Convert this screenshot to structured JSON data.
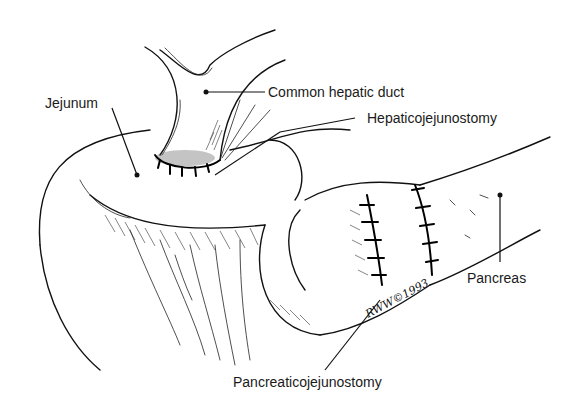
{
  "figure": {
    "labels": {
      "common_hepatic_duct": "Common hepatic duct",
      "jejunum": "Jejunum",
      "hepaticojejunostomy": "Hepaticojejunostomy",
      "pancreas": "Pancreas",
      "pancreaticojejunostomy": "Pancreaticojejunostomy"
    },
    "signature": "RWW©1993",
    "colors": {
      "ink": "#111111",
      "background": "#ffffff"
    }
  }
}
